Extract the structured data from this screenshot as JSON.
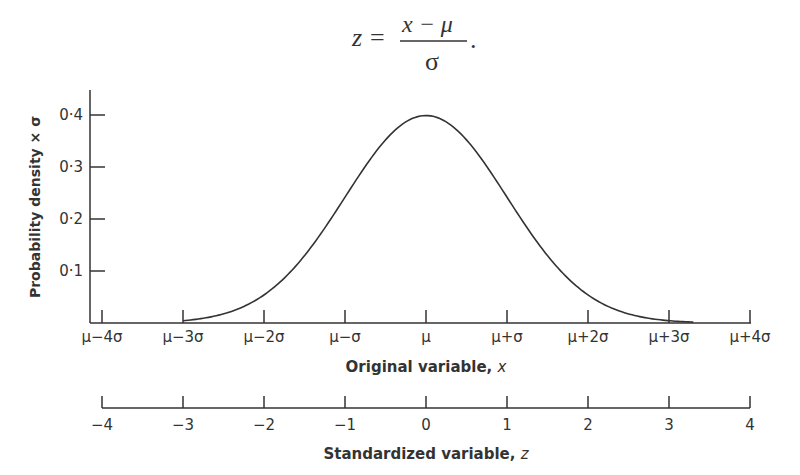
{
  "formula": {
    "lhs": "z",
    "equals": "=",
    "numerator": "x − μ",
    "denominator": "σ",
    "trailing": "."
  },
  "chart_data": {
    "type": "line",
    "title": "",
    "ylabel": "Probability density × σ",
    "xlabel": "Original variable, x",
    "x2label": "Standardized variable, z",
    "ylim": [
      0,
      0.44
    ],
    "xlim": [
      -4,
      4
    ],
    "yticks": [
      "0·1",
      "0·2",
      "0·3",
      "0·4"
    ],
    "ytick_values": [
      0.1,
      0.2,
      0.3,
      0.4
    ],
    "xticks": [
      "μ−4σ",
      "μ−3σ",
      "μ−2σ",
      "μ−σ",
      "μ",
      "μ+σ",
      "μ+2σ",
      "μ+3σ",
      "μ+4σ"
    ],
    "x2ticks": [
      "−4",
      "−3",
      "−2",
      "−1",
      "0",
      "1",
      "2",
      "3",
      "4"
    ],
    "tick_positions": [
      -4,
      -3,
      -2,
      -1,
      0,
      1,
      2,
      3,
      4
    ],
    "grid": false,
    "legend": null,
    "series": [
      {
        "name": "Normal density",
        "curve_range": [
          -3,
          3.3
        ],
        "x": [
          -3,
          -2.5,
          -2,
          -1.5,
          -1,
          -0.5,
          0,
          0.5,
          1,
          1.5,
          2,
          2.5,
          3
        ],
        "y": [
          0.004,
          0.018,
          0.054,
          0.13,
          0.242,
          0.352,
          0.399,
          0.352,
          0.242,
          0.13,
          0.054,
          0.018,
          0.004
        ]
      }
    ]
  }
}
